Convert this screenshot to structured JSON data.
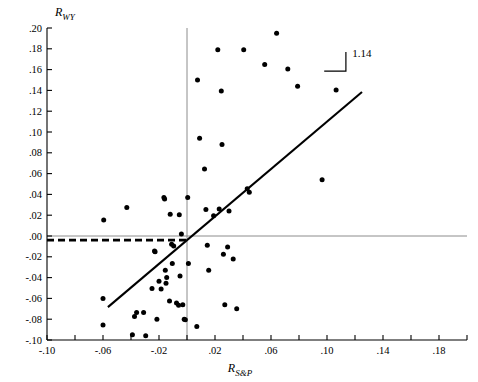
{
  "chart_data": {
    "type": "scatter",
    "title": "",
    "subtitle": "",
    "xlabel": "R_S&P",
    "ylabel": "R_WY",
    "xlabel_main": "R",
    "xlabel_sub": "S&P",
    "ylabel_main": "R",
    "ylabel_sub": "WY",
    "xlim": [
      -0.1,
      0.2
    ],
    "ylim": [
      -0.1,
      0.2
    ],
    "xticks": [
      -0.1,
      -0.08,
      -0.06,
      -0.04,
      -0.02,
      0.0,
      0.02,
      0.04,
      0.06,
      0.08,
      0.1,
      0.12,
      0.14,
      0.16,
      0.18,
      0.2
    ],
    "xtick_labels": [
      "-.10",
      "",
      "-.06",
      "",
      "-.02",
      "",
      ".02",
      "",
      ".06",
      "",
      ".10",
      "",
      ".14",
      "",
      ".18",
      ""
    ],
    "yticks": [
      -0.1,
      -0.08,
      -0.06,
      -0.04,
      -0.02,
      0.0,
      0.02,
      0.04,
      0.06,
      0.08,
      0.1,
      0.12,
      0.14,
      0.16,
      0.18,
      0.2
    ],
    "ytick_labels": [
      "-.10",
      "-.08",
      "-.06",
      "-.04",
      "-.02",
      ".00",
      ".02",
      ".04",
      ".06",
      ".08",
      ".10",
      ".12",
      ".14",
      ".16",
      ".18",
      ".20"
    ],
    "grid": false,
    "legend": null,
    "annotations": [
      {
        "name": "slope-label",
        "text": "1.14",
        "x": 0.118,
        "y": 0.172
      }
    ],
    "reference_lines": [
      {
        "name": "zero-vertical-line",
        "orientation": "vertical",
        "value": 0.0,
        "style": "solid"
      },
      {
        "name": "zero-horizontal-line",
        "orientation": "horizontal",
        "value": 0.0,
        "style": "solid"
      },
      {
        "name": "intercept-dashed-line",
        "orientation": "horizontal",
        "value": -0.004,
        "style": "dashed",
        "x_from": -0.1,
        "x_to": 0.002
      }
    ],
    "fit_line": {
      "name": "regression-line",
      "slope": 1.14,
      "intercept": -0.004,
      "x_from": -0.0565,
      "x_to": 0.125
    },
    "slope_triangle": {
      "x_left": 0.098,
      "x_right": 0.1135,
      "y_bottom": 0.1585,
      "y_top": 0.177
    },
    "points": [
      {
        "x": -0.0595,
        "y": 0.0155
      },
      {
        "x": -0.06,
        "y": -0.06
      },
      {
        "x": -0.06,
        "y": -0.0855
      },
      {
        "x": -0.043,
        "y": 0.0275
      },
      {
        "x": -0.039,
        "y": -0.095
      },
      {
        "x": -0.0375,
        "y": -0.0775
      },
      {
        "x": -0.036,
        "y": -0.0735
      },
      {
        "x": -0.031,
        "y": -0.0735
      },
      {
        "x": -0.0295,
        "y": -0.096
      },
      {
        "x": -0.025,
        "y": -0.0505
      },
      {
        "x": -0.0232,
        "y": -0.0145
      },
      {
        "x": -0.0228,
        "y": -0.0152
      },
      {
        "x": -0.0215,
        "y": -0.08
      },
      {
        "x": -0.02,
        "y": -0.0435
      },
      {
        "x": -0.0185,
        "y": -0.051
      },
      {
        "x": -0.0165,
        "y": 0.037
      },
      {
        "x": -0.016,
        "y": 0.0355
      },
      {
        "x": -0.0155,
        "y": -0.033
      },
      {
        "x": -0.015,
        "y": -0.0455
      },
      {
        "x": -0.0145,
        "y": -0.04
      },
      {
        "x": -0.0125,
        "y": -0.0625
      },
      {
        "x": -0.012,
        "y": 0.021
      },
      {
        "x": -0.011,
        "y": -0.008
      },
      {
        "x": -0.0105,
        "y": -0.0265
      },
      {
        "x": -0.0095,
        "y": -0.0095
      },
      {
        "x": -0.0075,
        "y": -0.0645
      },
      {
        "x": -0.006,
        "y": -0.0665
      },
      {
        "x": -0.0055,
        "y": 0.0205
      },
      {
        "x": -0.005,
        "y": -0.0385
      },
      {
        "x": -0.004,
        "y": 0.002
      },
      {
        "x": -0.003,
        "y": -0.066
      },
      {
        "x": -0.002,
        "y": -0.08
      },
      {
        "x": -0.0012,
        "y": -0.0805
      },
      {
        "x": 0.0005,
        "y": 0.037
      },
      {
        "x": 0.001,
        "y": -0.0265
      },
      {
        "x": 0.007,
        "y": -0.087
      },
      {
        "x": 0.0075,
        "y": 0.15
      },
      {
        "x": 0.009,
        "y": 0.094
      },
      {
        "x": 0.0125,
        "y": 0.0645
      },
      {
        "x": 0.0135,
        "y": 0.0255
      },
      {
        "x": 0.0145,
        "y": -0.009
      },
      {
        "x": 0.0155,
        "y": -0.033
      },
      {
        "x": 0.019,
        "y": 0.0195
      },
      {
        "x": 0.022,
        "y": 0.179
      },
      {
        "x": 0.023,
        "y": 0.026
      },
      {
        "x": 0.0245,
        "y": 0.1395
      },
      {
        "x": 0.025,
        "y": 0.088
      },
      {
        "x": 0.026,
        "y": -0.0175
      },
      {
        "x": 0.027,
        "y": -0.066
      },
      {
        "x": 0.029,
        "y": -0.0105
      },
      {
        "x": 0.03,
        "y": 0.024
      },
      {
        "x": 0.033,
        "y": -0.022
      },
      {
        "x": 0.0355,
        "y": -0.07
      },
      {
        "x": 0.0405,
        "y": 0.179
      },
      {
        "x": 0.0555,
        "y": 0.165
      },
      {
        "x": 0.064,
        "y": 0.195
      },
      {
        "x": 0.072,
        "y": 0.1605
      },
      {
        "x": 0.079,
        "y": 0.144
      },
      {
        "x": 0.0965,
        "y": 0.054
      },
      {
        "x": 0.1065,
        "y": 0.1405
      },
      {
        "x": 0.043,
        "y": 0.0455
      },
      {
        "x": 0.0445,
        "y": 0.042
      }
    ],
    "colors": {
      "point": "#000000",
      "fit_line": "#000000",
      "reference_line": "#808080",
      "dashed_line": "#000000",
      "axis": "#000000",
      "background": "#ffffff"
    }
  }
}
